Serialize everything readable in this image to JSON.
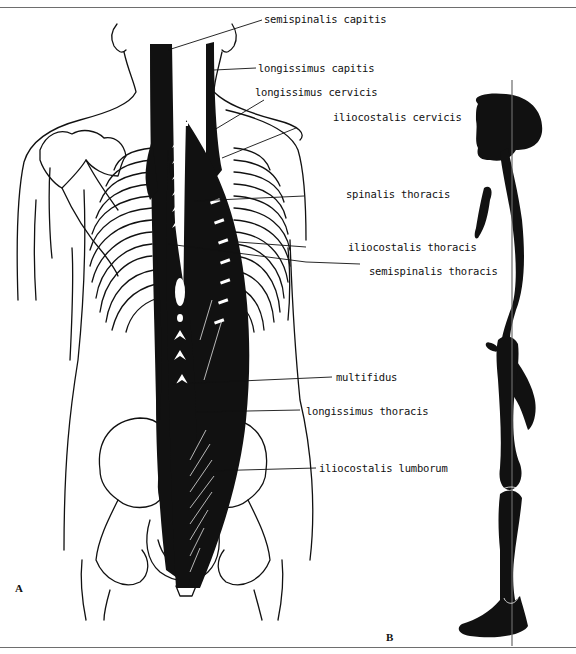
{
  "figure": {
    "panels": [
      {
        "letter": "A",
        "description": "Posterior view of back showing erector spinae and deep back muscles (black) over skeleton outline"
      },
      {
        "letter": "B",
        "description": "Lateral silhouette of skeleton with vertical line of gravity"
      }
    ],
    "labels": [
      {
        "text": "semispinalis capitis"
      },
      {
        "text": "longissimus capitis"
      },
      {
        "text": "longissimus cervicis"
      },
      {
        "text": "iliocostalis cervicis"
      },
      {
        "text": "spinalis thoracis"
      },
      {
        "text": "iliocostalis thoracis"
      },
      {
        "text": "semispinalis thoracis"
      },
      {
        "text": "multifidus"
      },
      {
        "text": "longissimus thoracis"
      },
      {
        "text": "iliocostalis lumborum"
      }
    ],
    "colors": {
      "ink": "#111111",
      "frame": "#6e6e6e",
      "background": "#ffffff"
    }
  }
}
